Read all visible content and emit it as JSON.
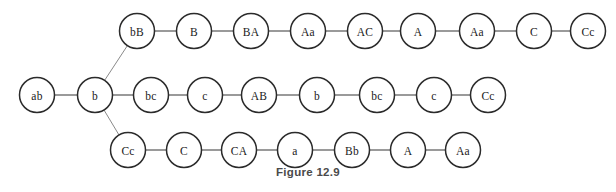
{
  "figure": {
    "caption": "Figure 12.9",
    "background_color": "#ffffff",
    "node_stroke_color": "#2b2b2b",
    "node_fill_color": "#ffffff",
    "edge_color": "#6f6f6f",
    "label_color": "#1a1a1a",
    "caption_color": "#4a4a4a",
    "node_radius": 17.5
  },
  "graph": {
    "type": "node-link-diagram",
    "layout": "three-branch-chain",
    "nodes": [
      {
        "id": "n0",
        "label": "ab",
        "x": 37,
        "y": 95,
        "row": "trunk"
      },
      {
        "id": "n1",
        "label": "b",
        "x": 95,
        "y": 95,
        "row": "trunk"
      },
      {
        "id": "t0",
        "label": "bB",
        "x": 137,
        "y": 31,
        "row": "top"
      },
      {
        "id": "t1",
        "label": "B",
        "x": 194,
        "y": 31,
        "row": "top"
      },
      {
        "id": "t2",
        "label": "BA",
        "x": 251,
        "y": 31,
        "row": "top"
      },
      {
        "id": "t3",
        "label": "Aa",
        "x": 308,
        "y": 31,
        "row": "top"
      },
      {
        "id": "t4",
        "label": "AC",
        "x": 365,
        "y": 31,
        "row": "top"
      },
      {
        "id": "t5",
        "label": "A",
        "x": 418,
        "y": 31,
        "row": "top"
      },
      {
        "id": "t6",
        "label": "Aa",
        "x": 477,
        "y": 31,
        "row": "top"
      },
      {
        "id": "t7",
        "label": "C",
        "x": 534,
        "y": 31,
        "row": "top"
      },
      {
        "id": "t8",
        "label": "Cc",
        "x": 588,
        "y": 31,
        "row": "top"
      },
      {
        "id": "m0",
        "label": "bc",
        "x": 151,
        "y": 95,
        "row": "middle"
      },
      {
        "id": "m1",
        "label": "c",
        "x": 205,
        "y": 95,
        "row": "middle"
      },
      {
        "id": "m2",
        "label": "AB",
        "x": 259,
        "y": 95,
        "row": "middle"
      },
      {
        "id": "m3",
        "label": "b",
        "x": 317,
        "y": 95,
        "row": "middle"
      },
      {
        "id": "m4",
        "label": "bc",
        "x": 377,
        "y": 95,
        "row": "middle"
      },
      {
        "id": "m5",
        "label": "c",
        "x": 434,
        "y": 95,
        "row": "middle"
      },
      {
        "id": "m6",
        "label": "Cc",
        "x": 488,
        "y": 95,
        "row": "middle"
      },
      {
        "id": "b0",
        "label": "Cc",
        "x": 128,
        "y": 150,
        "row": "bottom"
      },
      {
        "id": "b1",
        "label": "C",
        "x": 184,
        "y": 150,
        "row": "bottom"
      },
      {
        "id": "b2",
        "label": "CA",
        "x": 239,
        "y": 150,
        "row": "bottom"
      },
      {
        "id": "b3",
        "label": "a",
        "x": 295,
        "y": 150,
        "row": "bottom"
      },
      {
        "id": "b4",
        "label": "Bb",
        "x": 352,
        "y": 150,
        "row": "bottom"
      },
      {
        "id": "b5",
        "label": "A",
        "x": 408,
        "y": 150,
        "row": "bottom"
      },
      {
        "id": "b6",
        "label": "Aa",
        "x": 463,
        "y": 150,
        "row": "bottom"
      }
    ],
    "edges": [
      {
        "from": "n0",
        "to": "n1",
        "kind": "straight"
      },
      {
        "from": "n1",
        "to": "t0",
        "kind": "branch"
      },
      {
        "from": "n1",
        "to": "m0",
        "kind": "straight"
      },
      {
        "from": "n1",
        "to": "b0",
        "kind": "branch"
      },
      {
        "from": "t0",
        "to": "t1",
        "kind": "straight"
      },
      {
        "from": "t1",
        "to": "t2",
        "kind": "straight"
      },
      {
        "from": "t2",
        "to": "t3",
        "kind": "straight"
      },
      {
        "from": "t3",
        "to": "t4",
        "kind": "straight"
      },
      {
        "from": "t4",
        "to": "t5",
        "kind": "straight"
      },
      {
        "from": "t5",
        "to": "t6",
        "kind": "straight"
      },
      {
        "from": "t6",
        "to": "t7",
        "kind": "straight"
      },
      {
        "from": "t7",
        "to": "t8",
        "kind": "straight"
      },
      {
        "from": "m0",
        "to": "m1",
        "kind": "straight"
      },
      {
        "from": "m1",
        "to": "m2",
        "kind": "straight"
      },
      {
        "from": "m2",
        "to": "m3",
        "kind": "straight"
      },
      {
        "from": "m3",
        "to": "m4",
        "kind": "straight"
      },
      {
        "from": "m4",
        "to": "m5",
        "kind": "straight"
      },
      {
        "from": "m5",
        "to": "m6",
        "kind": "straight"
      },
      {
        "from": "b0",
        "to": "b1",
        "kind": "straight"
      },
      {
        "from": "b1",
        "to": "b2",
        "kind": "straight"
      },
      {
        "from": "b2",
        "to": "b3",
        "kind": "straight"
      },
      {
        "from": "b3",
        "to": "b4",
        "kind": "straight"
      },
      {
        "from": "b4",
        "to": "b5",
        "kind": "straight"
      },
      {
        "from": "b5",
        "to": "b6",
        "kind": "straight"
      }
    ]
  }
}
